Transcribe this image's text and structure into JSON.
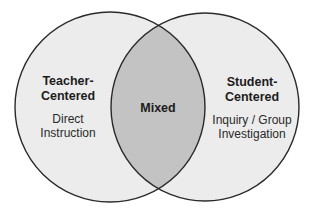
{
  "diagram": {
    "type": "venn",
    "colors": {
      "background": "#ffffff",
      "circle_fill": "#ececec",
      "overlap_fill": "#c3c3c3",
      "outline": "#2a2a2a",
      "text": "#1c1c1c"
    },
    "sets": [
      {
        "id": "teacher",
        "title_lines": [
          "Teacher-",
          "Centered"
        ],
        "description_lines": [
          "Direct",
          "Instruction"
        ]
      },
      {
        "id": "student",
        "title_lines": [
          "Student-",
          "Centered"
        ],
        "description_lines": [
          "Inquiry / Group",
          "Investigation"
        ]
      }
    ],
    "overlap": {
      "label": "Mixed"
    }
  }
}
